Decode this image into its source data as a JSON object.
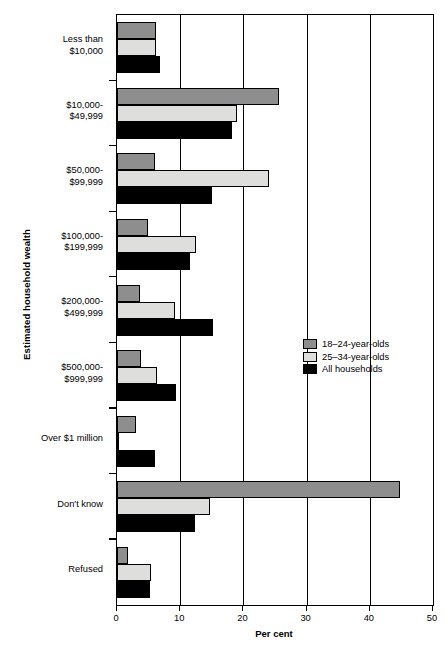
{
  "chart_data": {
    "type": "bar",
    "orientation": "horizontal",
    "title": "",
    "xlabel": "Per cent",
    "ylabel": "Estimated household wealth",
    "xlim": [
      0,
      50
    ],
    "xticks": [
      0,
      10,
      20,
      30,
      40,
      50
    ],
    "xtick_labels": [
      "0",
      "10",
      "20",
      "30",
      "40",
      "50"
    ],
    "grid": "vertical",
    "legend_position": "middle-right",
    "categories": [
      "Less than\n$10,000",
      "$10,000-\n$49,999",
      "$50,000-\n$99,999",
      "$100,000-\n$199,999",
      "$200,000-\n$499,999",
      "$500,000-\n$999,999",
      "Over $1 million",
      "Don't know",
      "Refused"
    ],
    "series": [
      {
        "name": "18–24-year-olds",
        "color": "#8e8e8e",
        "values": [
          6.2,
          25.6,
          6.0,
          4.9,
          3.7,
          3.8,
          3.0,
          44.7,
          1.8
        ]
      },
      {
        "name": "25–34-year-olds",
        "color": "#dededd",
        "values": [
          6.1,
          19.0,
          24.0,
          12.5,
          9.2,
          6.3,
          0.3,
          14.7,
          5.4
        ]
      },
      {
        "name": "All households",
        "color": "#000000",
        "values": [
          6.8,
          18.2,
          15.0,
          11.5,
          15.2,
          9.3,
          6.0,
          12.3,
          5.3
        ]
      }
    ]
  },
  "legend": {
    "entries": [
      {
        "label": "18–24-year-olds",
        "color": "#8e8e8e"
      },
      {
        "label": "25–34-year-olds",
        "color": "#dededd"
      },
      {
        "label": "All households",
        "color": "#000000"
      }
    ]
  }
}
